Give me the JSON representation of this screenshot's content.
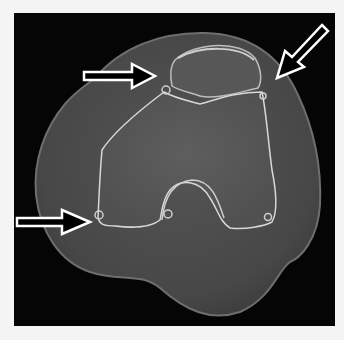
{
  "image": {
    "description": "Axial CT slice of the knee showing distal femur, patella and surrounding soft tissue, with three white outlined arrows",
    "colors": {
      "border": "#f4f4f4",
      "panel": "#050505",
      "soft_tissue": "#4a4a4a",
      "soft_tissue_edge": "#6e6e6e",
      "bone": "#555555",
      "cortex": "#d8d8d8",
      "arrow_fill": "#000000",
      "arrow_stroke": "#ffffff"
    },
    "arrows": [
      {
        "name": "arrow-patella-medial",
        "direction": "right",
        "tail": [
          83,
          75
        ],
        "tip": [
          155,
          75
        ]
      },
      {
        "name": "arrow-top-right",
        "direction": "down-left",
        "tail": [
          326,
          28
        ],
        "tip": [
          277,
          78
        ]
      },
      {
        "name": "arrow-lower-left",
        "direction": "right",
        "tail": [
          16,
          222
        ],
        "tip": [
          90,
          222
        ]
      }
    ]
  }
}
